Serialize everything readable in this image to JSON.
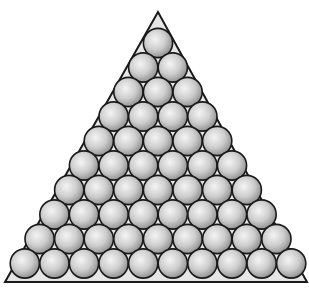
{
  "figure": {
    "rows": 10,
    "total_spheres": 55,
    "triangle": {
      "apex": [
        158,
        12
      ],
      "bottom_left": [
        5,
        282
      ],
      "bottom_right": [
        307,
        282
      ]
    },
    "sphere_radius": 14.6,
    "top_center": [
      158,
      43
    ],
    "row_spacing": 24.5,
    "col_spacing": 29.6,
    "colors": {
      "background": "#ffffff",
      "outline": "#1a1a1a",
      "sphere_light": "#f2f2f2",
      "sphere_mid": "#c8c8c8",
      "sphere_dark": "#8c8c8c",
      "gap_fill": "#e6e6e6"
    }
  }
}
